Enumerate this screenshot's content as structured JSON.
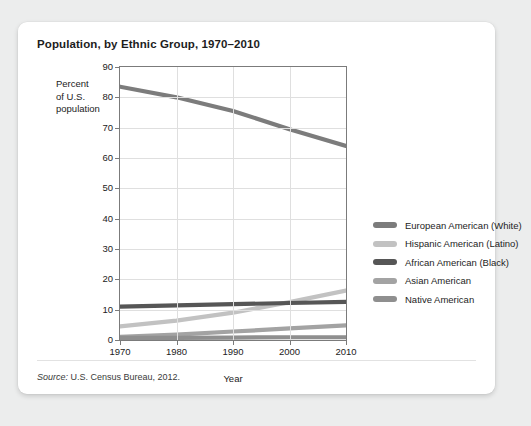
{
  "card": {
    "title": "Population, by Ethnic Group, 1970–2010",
    "source_word": "Source:",
    "source_text": " U.S. Census Bureau, 2012."
  },
  "chart_data": {
    "type": "line",
    "title": "Population, by Ethnic Group, 1970–2010",
    "xlabel": "Year",
    "ylabel": "Percent of U.S. population",
    "ylabel_lines": [
      "Percent",
      "of U.S.",
      "population"
    ],
    "x": [
      1970,
      1980,
      1990,
      2000,
      2010
    ],
    "xticklabels": [
      "1970",
      "1980",
      "1990",
      "2000",
      "2010"
    ],
    "yticks": [
      0,
      10,
      20,
      30,
      40,
      50,
      60,
      70,
      80,
      90
    ],
    "yticklabels": [
      "0",
      "10",
      "20",
      "30",
      "40",
      "50",
      "60",
      "70",
      "80",
      "90"
    ],
    "xlim": [
      1970,
      2010
    ],
    "ylim": [
      0,
      90
    ],
    "grid": true,
    "legend_position": "right",
    "series": [
      {
        "name": "European American (White)",
        "color": "#7c7c7c",
        "values": [
          83.5,
          80.0,
          75.5,
          69.5,
          64.0
        ]
      },
      {
        "name": "Hispanic American (Latino)",
        "color": "#c2c2c2",
        "values": [
          4.5,
          6.4,
          9.0,
          12.5,
          16.3
        ]
      },
      {
        "name": "African American (Black)",
        "color": "#565656",
        "values": [
          11.0,
          11.4,
          11.8,
          12.2,
          12.6
        ]
      },
      {
        "name": "Asian American",
        "color": "#a3a3a3",
        "values": [
          1.0,
          1.8,
          2.8,
          3.8,
          4.8
        ]
      },
      {
        "name": "Native American",
        "color": "#8f8f8f",
        "values": [
          0.7,
          0.7,
          0.8,
          0.9,
          0.9
        ]
      }
    ]
  },
  "legend": {
    "items": [
      {
        "label": "European American (White)",
        "color": "#7c7c7c"
      },
      {
        "label": "Hispanic American (Latino)",
        "color": "#c2c2c2"
      },
      {
        "label": "African American (Black)",
        "color": "#565656"
      },
      {
        "label": "Asian American",
        "color": "#a3a3a3"
      },
      {
        "label": "Native American",
        "color": "#8f8f8f"
      }
    ]
  }
}
